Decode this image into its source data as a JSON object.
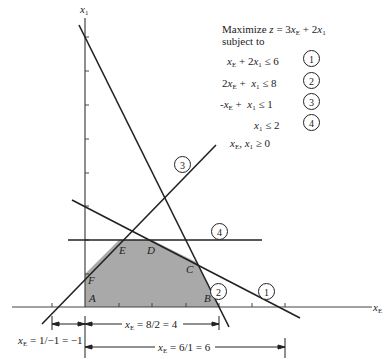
{
  "problem": {
    "objective": "Maximize z = 3x",
    "objective_full": "Maximize z = 3xE + 2x1",
    "subject_to": "subject to",
    "constraints": [
      {
        "expr": "xE + 2x1 ≤ 6",
        "id": "1"
      },
      {
        "expr": "2xE + x1 ≤ 8",
        "id": "2"
      },
      {
        "expr": "−xE + x1 ≤ 1",
        "id": "3"
      },
      {
        "expr": "x1 ≤ 2",
        "id": "4"
      }
    ],
    "nonneg": "xE, x1 ≥ 0"
  },
  "axes": {
    "x_label": "x",
    "x_sub": "E",
    "y_label": "x",
    "y_sub": "1"
  },
  "vertices": [
    {
      "name": "A",
      "x": 0,
      "y": 0
    },
    {
      "name": "B",
      "x": 4,
      "y": 0
    },
    {
      "name": "C",
      "x": 3.333,
      "y": 1.333
    },
    {
      "name": "D",
      "x": 2,
      "y": 2
    },
    {
      "name": "E",
      "x": 1,
      "y": 2
    },
    {
      "name": "F",
      "x": 0,
      "y": 1
    }
  ],
  "line_labels": [
    "1",
    "2",
    "3",
    "4"
  ],
  "intercepts": [
    {
      "text_pre": "x",
      "sub": "E",
      "text_post": " = 1/−1 = −1"
    },
    {
      "text_pre": "x",
      "sub": "E",
      "text_post": " = 8/2 = 4"
    },
    {
      "text_pre": "x",
      "sub": "E",
      "text_post": " = 6/1 = 6"
    }
  ],
  "colors": {
    "feasible_region": "#a9a9a9",
    "lines": "#222222"
  }
}
